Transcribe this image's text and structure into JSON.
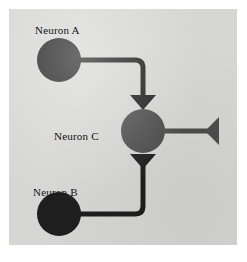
{
  "figure": {
    "panel_background_color": "#d6d6d4",
    "page_background_color": "#ffffff"
  },
  "labels": {
    "neuron_a": "Neuron A",
    "neuron_b": "Neuron B",
    "neuron_c": "Neuron C"
  },
  "diagram_data": {
    "type": "diagram",
    "nodes": [
      {
        "id": "neuron_a",
        "label": "Neuron A",
        "shape": "circle",
        "color": "#1e1e1e",
        "cx": 50,
        "cy": 51,
        "r": 22
      },
      {
        "id": "neuron_b",
        "label": "Neuron B",
        "shape": "circle",
        "color": "#1e1e1e",
        "cx": 50,
        "cy": 205,
        "r": 22
      },
      {
        "id": "neuron_c",
        "label": "Neuron C",
        "shape": "circle",
        "color": "#4d4d4d",
        "cx": 134,
        "cy": 122,
        "r": 22
      }
    ],
    "edges": [
      {
        "id": "axon_a_to_c",
        "from": "neuron_a",
        "to": "neuron_c",
        "color": "#1e1e1e",
        "width": 5,
        "terminal": "synapse-triangle-down"
      },
      {
        "id": "axon_b_to_c",
        "from": "neuron_b",
        "to": "neuron_c",
        "color": "#1e1e1e",
        "width": 5,
        "terminal": "synapse-triangle-down"
      },
      {
        "id": "axon_c_output",
        "from": "neuron_c",
        "to": "output_terminal",
        "color": "#4d4d4d",
        "width": 5,
        "terminal": "terminal-triangle-left"
      }
    ],
    "terminals": [
      {
        "id": "synapse_a_onto_c",
        "shape": "triangle-down",
        "color": "#1e1e1e",
        "cx": 134,
        "top_y": 86,
        "bottom_y": 100,
        "half_width": 13
      },
      {
        "id": "synapse_b_onto_c",
        "shape": "triangle-down",
        "color": "#1e1e1e",
        "cx": 134,
        "top_y": 145,
        "bottom_y": 159,
        "half_width": 13
      },
      {
        "id": "output_terminal_c",
        "shape": "triangle-left",
        "color": "#4d4d4d",
        "tip_x": 196,
        "base_x": 209,
        "cy": 122,
        "half_height": 14
      }
    ]
  }
}
